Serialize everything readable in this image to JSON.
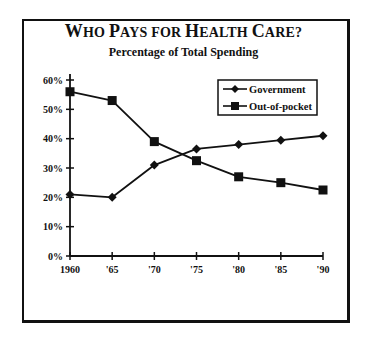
{
  "chart_data": {
    "type": "line",
    "title": "Who Pays for Health Care?",
    "subtitle": "Percentage of Total Spending",
    "xlabel": "",
    "ylabel": "",
    "categories": [
      "1960",
      "'65",
      "'70",
      "'75",
      "'80",
      "'85",
      "'90"
    ],
    "yticks": [
      "0%",
      "10%",
      "20%",
      "30%",
      "40%",
      "50%",
      "60%"
    ],
    "ylim": [
      0,
      60
    ],
    "grid": false,
    "legend_position": "upper right",
    "series": [
      {
        "name": "Government",
        "marker": "diamond",
        "values": [
          21,
          20,
          31,
          36.5,
          38,
          39.5,
          41
        ]
      },
      {
        "name": "Out-of-pocket",
        "marker": "square",
        "values": [
          56,
          53,
          39,
          32.5,
          27,
          25,
          22.5
        ]
      }
    ]
  },
  "title": {
    "parts": [
      {
        "text": "W",
        "big": true
      },
      {
        "text": "HO ",
        "big": false
      },
      {
        "text": "P",
        "big": true
      },
      {
        "text": "AYS FOR ",
        "big": false
      },
      {
        "text": "H",
        "big": true
      },
      {
        "text": "EALTH ",
        "big": false
      },
      {
        "text": "C",
        "big": true
      },
      {
        "text": "ARE?",
        "big": false
      }
    ]
  },
  "subtitle": "Percentage of Total Spending",
  "legend": {
    "items": [
      {
        "label": "Government",
        "marker": "diamond-icon"
      },
      {
        "label": "Out-of-pocket",
        "marker": "square-icon"
      }
    ]
  },
  "colors": {
    "ink": "#111111",
    "background": "#ffffff"
  }
}
